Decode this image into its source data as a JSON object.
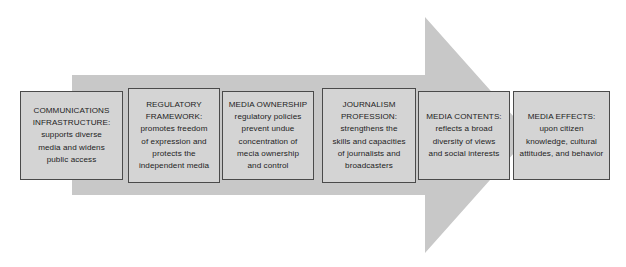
{
  "diagram": {
    "arrow": {
      "name": "process-arrow",
      "direction": "right",
      "fill_color": "#c8c8c8"
    },
    "box_style": {
      "fill_color": "#d4d4d4",
      "border_color": "#4a4a4a",
      "text_color": "#1d1d1d"
    },
    "stages": [
      {
        "id": "communications-infrastructure",
        "heading": "COMMUNICATIONS INFRASTRUCTURE:",
        "description": "supports  diverse media and widens public access",
        "text": "COMMUNICATIONS\nINFRASTRUCTURE:\nsupports  diverse\nmedia and widens\npublic access"
      },
      {
        "id": "regulatory-framework",
        "heading": "REGULATORY FRAMEWORK:",
        "description": "promotes freedom of expression and protects the independent media",
        "text": "REGULATORY\nFRAMEWORK:\npromotes freedom\nof expression and\nprotects the\nindependent media"
      },
      {
        "id": "media-ownership",
        "heading": "MEDIA OWNERSHIP",
        "description": "regulatory policies prevent undue concentration of mecia ownership and control",
        "text": "MEDIA OWNERSHIP\nregulatory policies\nprevent undue\nconcentration of\nmecia ownership\nand control"
      },
      {
        "id": "journalism-profession",
        "heading": "JOURNALISM PROFESSION:",
        "description": "strengthens the skills and capacities of journalists and broadcasters",
        "text": "JOURNALISM\nPROFESSION:\nstrengthens the\nskills and capacities\nof journalists and\nbroadcasters"
      },
      {
        "id": "media-contents",
        "heading": "MEDIA CONTENTS:",
        "description": "reflects a broad diversity of views and social interests",
        "text": "MEDIA CONTENTS:\nreflects a broad\ndiversity of views\nand social interests"
      },
      {
        "id": "media-effects",
        "heading": "MEDIA EFFECTS:",
        "description": "upon citizen knowledge, cultural attitudes, and behavior",
        "text": "MEDIA EFFECTS:\nupon citizen\nknowledge, cultural\nattitudes, and behavior"
      }
    ]
  }
}
